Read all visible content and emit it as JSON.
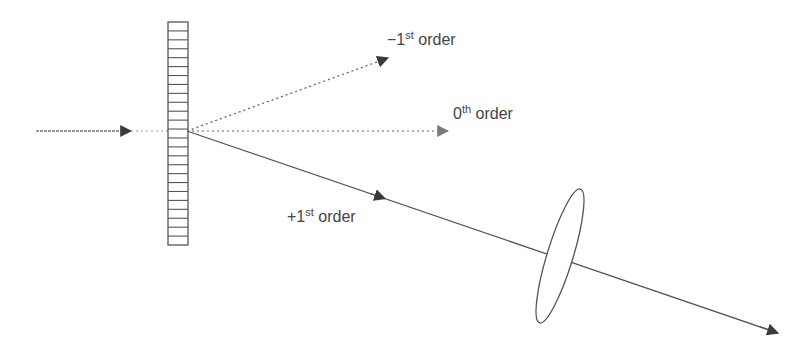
{
  "diagram": {
    "title": "",
    "colors": {
      "background": "#ffffff",
      "ray_solid": "#555555",
      "ray_minus1": "#666666",
      "ray_zero": "#999999",
      "incident": "#777777",
      "grating": "#555555",
      "lens_stroke": "#555555",
      "text": "#444444"
    },
    "labels": {
      "minus_first": {
        "prefix": "−1",
        "sup": "st",
        "suffix": " order"
      },
      "zeroth": {
        "prefix": "0",
        "sup": "th",
        "suffix": " order"
      },
      "plus_first": {
        "prefix": "+1",
        "sup": "st",
        "suffix": " order"
      }
    },
    "nodes": [
      {
        "id": "incident-beam",
        "type": "ray",
        "style": "dashed",
        "from": [
          36,
          131
        ],
        "to": [
          131,
          131
        ]
      },
      {
        "id": "grating",
        "type": "grating",
        "x": 168,
        "y": 22,
        "width": 20,
        "height": 223,
        "lines": 25
      },
      {
        "id": "minus-first-order",
        "type": "ray",
        "style": "dotted",
        "from": [
          187,
          131
        ],
        "to": [
          388,
          58
        ]
      },
      {
        "id": "zeroth-order",
        "type": "ray",
        "style": "dotted",
        "from": [
          187,
          131
        ],
        "to": [
          448,
          131
        ]
      },
      {
        "id": "plus-first-order",
        "type": "ray",
        "style": "solid",
        "from": [
          187,
          131
        ],
        "to": [
          778,
          333
        ]
      },
      {
        "id": "lens",
        "type": "lens",
        "cx": 560,
        "cy": 256,
        "rx": 13,
        "ry": 70,
        "rotate": 17
      }
    ]
  }
}
